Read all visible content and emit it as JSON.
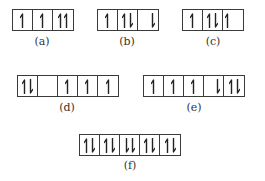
{
  "diagram": {
    "colors": {
      "line": "#3a3a3a",
      "arrow": "#222222",
      "label": "#333333"
    },
    "configs": [
      {
        "id": "a",
        "label": "(a)",
        "x": 12,
        "y": 9,
        "label_x": 42,
        "label_y": 35,
        "cells": [
          {
            "spins": [
              "up"
            ],
            "align": "center"
          },
          {
            "spins": [
              "up"
            ],
            "align": "center"
          },
          {
            "spins": [
              "up",
              "up"
            ],
            "align": "center"
          }
        ]
      },
      {
        "id": "b",
        "label": "(b)",
        "x": 97,
        "y": 9,
        "label_x": 127,
        "label_y": 35,
        "cells": [
          {
            "spins": [
              "up"
            ],
            "align": "center"
          },
          {
            "spins": [
              "up",
              "down"
            ],
            "align": "center"
          },
          {
            "spins": [
              "down"
            ],
            "align": "right"
          }
        ]
      },
      {
        "id": "c",
        "label": "(c)",
        "x": 182,
        "y": 9,
        "label_x": 213,
        "label_y": 35,
        "cells": [
          {
            "spins": [
              "up"
            ],
            "align": "center"
          },
          {
            "spins": [
              "up",
              "down"
            ],
            "align": "center"
          },
          {
            "spins": [
              "up"
            ],
            "align": "left"
          }
        ]
      },
      {
        "id": "d",
        "label": "(d)",
        "x": 17,
        "y": 75,
        "label_x": 67,
        "label_y": 101,
        "cells": [
          {
            "spins": [
              "up",
              "down"
            ],
            "align": "center"
          },
          {
            "spins": [],
            "align": "center"
          },
          {
            "spins": [
              "up"
            ],
            "align": "center"
          },
          {
            "spins": [
              "up"
            ],
            "align": "center"
          },
          {
            "spins": [
              "up"
            ],
            "align": "center"
          }
        ]
      },
      {
        "id": "e",
        "label": "(e)",
        "x": 143,
        "y": 75,
        "label_x": 194,
        "label_y": 101,
        "cells": [
          {
            "spins": [
              "up"
            ],
            "align": "center"
          },
          {
            "spins": [
              "up"
            ],
            "align": "center"
          },
          {
            "spins": [
              "up"
            ],
            "align": "center"
          },
          {
            "spins": [
              "down"
            ],
            "align": "right"
          },
          {
            "spins": [
              "up",
              "down"
            ],
            "align": "center"
          }
        ]
      },
      {
        "id": "f",
        "label": "(f)",
        "x": 79,
        "y": 134,
        "label_x": 130,
        "label_y": 159,
        "cells": [
          {
            "spins": [
              "up",
              "down"
            ],
            "align": "center"
          },
          {
            "spins": [
              "up",
              "down"
            ],
            "align": "center"
          },
          {
            "spins": [
              "down",
              "down"
            ],
            "align": "center"
          },
          {
            "spins": [
              "up",
              "down"
            ],
            "align": "center"
          },
          {
            "spins": [
              "up",
              "down"
            ],
            "align": "center"
          }
        ]
      }
    ]
  }
}
